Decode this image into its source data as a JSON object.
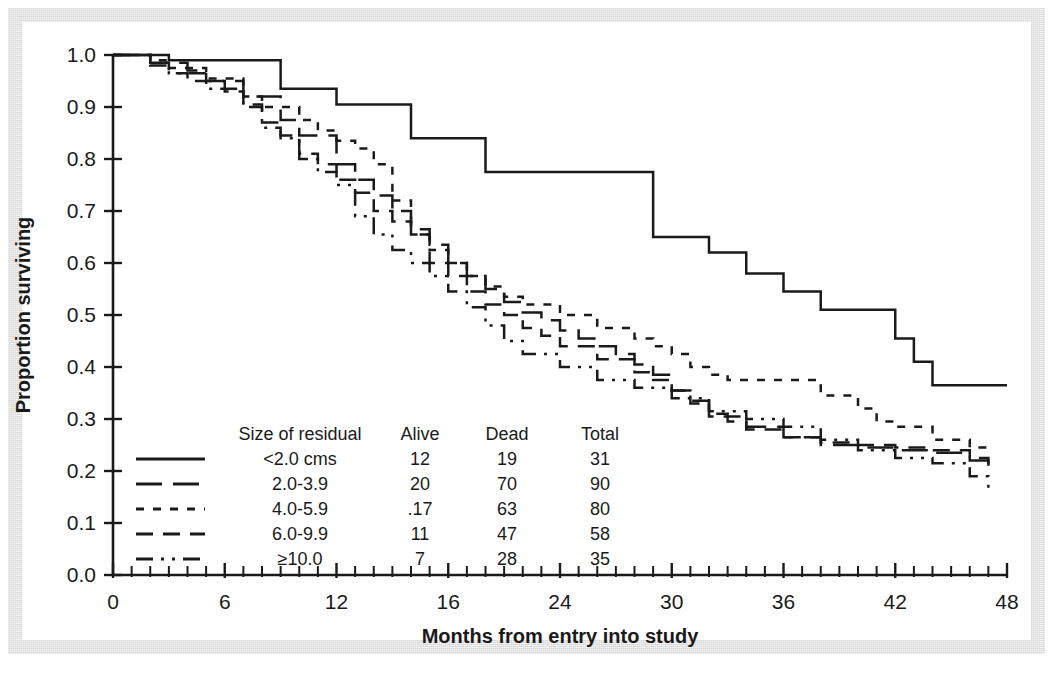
{
  "figure": {
    "kind": "kaplan-meier-survival-plot"
  },
  "chart_data": {
    "type": "line",
    "title": "",
    "subtitle": "",
    "xlabel": "Months from entry into study",
    "ylabel": "Proportion surviving",
    "xlim": [
      0,
      48
    ],
    "ylim": [
      0.0,
      1.0
    ],
    "grid": false,
    "legend_position": "lower-left-inside",
    "x_major_ticks": [
      0,
      6,
      12,
      16,
      24,
      30,
      36,
      42,
      48
    ],
    "x_major_tick_labels": [
      "0",
      "6",
      "12",
      "16",
      "24",
      "30",
      "36",
      "42",
      "48"
    ],
    "x_major_tick_positions": [
      0,
      6,
      12,
      18,
      24,
      30,
      36,
      42,
      48
    ],
    "x_minor_tick_step": 1,
    "y_ticks": [
      0.0,
      0.1,
      0.2,
      0.3,
      0.4,
      0.5,
      0.6,
      0.7,
      0.8,
      0.9,
      1.0
    ],
    "y_tick_labels": [
      "0.0",
      "0.1",
      "0.2",
      "0.3",
      "0.4",
      "0.5",
      "0.6",
      "0.7",
      "0.8",
      "0.9",
      "1.0"
    ],
    "step_interpolation": "step-after",
    "series": [
      {
        "name": "<2.0 cms",
        "dash": "none",
        "x": [
          0,
          2,
          3,
          8,
          9,
          11,
          12,
          14,
          16,
          17,
          20,
          29,
          30,
          32,
          34,
          36,
          38,
          40,
          42,
          43,
          44,
          48
        ],
        "y": [
          1.0,
          1.0,
          0.99,
          0.99,
          0.935,
          0.935,
          0.905,
          0.905,
          0.84,
          0.84,
          0.775,
          0.65,
          0.65,
          0.62,
          0.58,
          0.545,
          0.51,
          0.51,
          0.455,
          0.41,
          0.365,
          0.365
        ]
      },
      {
        "name": "2.0-3.9",
        "dash": "long",
        "x": [
          0,
          2,
          4,
          5,
          7,
          9,
          10,
          12,
          13,
          14,
          15,
          16,
          17,
          18,
          19,
          20,
          21,
          22,
          23,
          24,
          25,
          26,
          27,
          28,
          29,
          30,
          31,
          32,
          33,
          34,
          36,
          38,
          40,
          42,
          44,
          46,
          47
        ],
        "y": [
          1.0,
          0.985,
          0.97,
          0.95,
          0.92,
          0.875,
          0.845,
          0.79,
          0.76,
          0.73,
          0.7,
          0.665,
          0.635,
          0.6,
          0.575,
          0.55,
          0.525,
          0.505,
          0.49,
          0.47,
          0.455,
          0.44,
          0.425,
          0.405,
          0.385,
          0.355,
          0.335,
          0.31,
          0.295,
          0.285,
          0.265,
          0.25,
          0.245,
          0.24,
          0.235,
          0.22,
          0.2
        ]
      },
      {
        "name": "4.0-5.9",
        "dash": "dot",
        "x": [
          0,
          2,
          3,
          5,
          7,
          8,
          10,
          11,
          12,
          13,
          14,
          15,
          16,
          17,
          18,
          19,
          20,
          21,
          22,
          24,
          26,
          28,
          29,
          30,
          31,
          32,
          33,
          34,
          35,
          36,
          38,
          40,
          41,
          42,
          44,
          46,
          47
        ],
        "y": [
          1.0,
          0.99,
          0.975,
          0.955,
          0.92,
          0.9,
          0.875,
          0.855,
          0.835,
          0.82,
          0.79,
          0.72,
          0.655,
          0.625,
          0.6,
          0.575,
          0.555,
          0.535,
          0.52,
          0.5,
          0.475,
          0.455,
          0.44,
          0.425,
          0.4,
          0.385,
          0.375,
          0.375,
          0.375,
          0.375,
          0.345,
          0.32,
          0.295,
          0.285,
          0.26,
          0.245,
          0.24
        ]
      },
      {
        "name": "6.0-9.9",
        "dash": "dash",
        "x": [
          0,
          2,
          3,
          4,
          6,
          7,
          8,
          9,
          10,
          11,
          12,
          13,
          14,
          15,
          16,
          17,
          18,
          19,
          20,
          21,
          22,
          23,
          24,
          26,
          28,
          29,
          30,
          31,
          32,
          34,
          36,
          38,
          40,
          42,
          44,
          46,
          47
        ],
        "y": [
          1.0,
          0.985,
          0.965,
          0.95,
          0.93,
          0.905,
          0.87,
          0.845,
          0.81,
          0.79,
          0.76,
          0.735,
          0.7,
          0.68,
          0.655,
          0.6,
          0.575,
          0.545,
          0.52,
          0.5,
          0.475,
          0.46,
          0.44,
          0.415,
          0.39,
          0.375,
          0.355,
          0.33,
          0.305,
          0.28,
          0.265,
          0.255,
          0.25,
          0.245,
          0.24,
          0.225,
          0.2
        ]
      },
      {
        "name": ">=10.0",
        "dash": "dashdotdot",
        "x": [
          0,
          2,
          3,
          5,
          7,
          8,
          9,
          10,
          11,
          12,
          13,
          14,
          15,
          16,
          17,
          18,
          19,
          20,
          21,
          22,
          24,
          26,
          28,
          30,
          32,
          34,
          36,
          38,
          40,
          42,
          44,
          46,
          47
        ],
        "y": [
          1.0,
          0.98,
          0.965,
          0.935,
          0.9,
          0.86,
          0.84,
          0.8,
          0.775,
          0.75,
          0.69,
          0.655,
          0.625,
          0.6,
          0.575,
          0.545,
          0.515,
          0.48,
          0.45,
          0.425,
          0.4,
          0.375,
          0.36,
          0.34,
          0.315,
          0.3,
          0.285,
          0.26,
          0.24,
          0.225,
          0.215,
          0.19,
          0.155
        ]
      }
    ]
  },
  "legend": {
    "headers": {
      "style": "",
      "group": "Size of residual",
      "alive": "Alive",
      "dead": "Dead",
      "total": "Total"
    },
    "rows": [
      {
        "label": "<2.0 cms",
        "alive": "12",
        "dead": "19",
        "total": "31",
        "dash": "none"
      },
      {
        "label": "2.0-3.9",
        "alive": "20",
        "dead": "70",
        "total": "90",
        "dash": "long"
      },
      {
        "label": "4.0-5.9",
        "alive": ".17",
        "dead": "63",
        "total": "80",
        "dash": "dot"
      },
      {
        "label": "6.0-9.9",
        "alive": "11",
        "dead": "47",
        "total": "58",
        "dash": "dash"
      },
      {
        "label": "≥10.0",
        "alive": "7",
        "dead": "28",
        "total": "35",
        "dash": "dashdotdot"
      }
    ]
  },
  "colors": {
    "ink": "#1a1a1a",
    "page": "#ffffff",
    "frame": "#d5d5d5"
  }
}
